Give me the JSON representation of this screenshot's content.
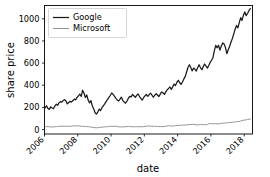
{
  "chart_data": {
    "type": "line",
    "title": "",
    "xlabel": "date",
    "ylabel": "share price",
    "xlim": [
      2006.0,
      2018.5
    ],
    "ylim": [
      -40,
      1120
    ],
    "xticks": [
      2006,
      2008,
      2010,
      2012,
      2014,
      2016,
      2018
    ],
    "xticklabels": [
      "2006",
      "2008",
      "2010",
      "2012",
      "2014",
      "2016",
      "2018"
    ],
    "xtick_rotation": 45,
    "yticks": [
      0,
      200,
      400,
      600,
      800,
      1000
    ],
    "yticklabels": [
      "0",
      "200",
      "400",
      "600",
      "800",
      "1000"
    ],
    "grid": false,
    "legend_position": "upper left",
    "legend_entries": [
      "Google",
      "Microsoft"
    ],
    "colors": {
      "google": "#1a1a1a",
      "microsoft": "#8c8c8c",
      "axis": "#000000",
      "background": "#ffffff",
      "legend_border": "#cccccc"
    },
    "x": [
      2006.04,
      2006.12,
      2006.21,
      2006.29,
      2006.37,
      2006.46,
      2006.54,
      2006.62,
      2006.71,
      2006.79,
      2006.87,
      2006.96,
      2007.04,
      2007.12,
      2007.21,
      2007.29,
      2007.37,
      2007.46,
      2007.54,
      2007.62,
      2007.71,
      2007.79,
      2007.87,
      2007.96,
      2008.04,
      2008.12,
      2008.21,
      2008.29,
      2008.37,
      2008.46,
      2008.54,
      2008.62,
      2008.71,
      2008.79,
      2008.87,
      2008.96,
      2009.04,
      2009.12,
      2009.21,
      2009.29,
      2009.37,
      2009.46,
      2009.54,
      2009.62,
      2009.71,
      2009.79,
      2009.87,
      2009.96,
      2010.04,
      2010.12,
      2010.21,
      2010.29,
      2010.37,
      2010.46,
      2010.54,
      2010.62,
      2010.71,
      2010.79,
      2010.87,
      2010.96,
      2011.04,
      2011.12,
      2011.21,
      2011.29,
      2011.37,
      2011.46,
      2011.54,
      2011.62,
      2011.71,
      2011.79,
      2011.87,
      2011.96,
      2012.04,
      2012.12,
      2012.21,
      2012.29,
      2012.37,
      2012.46,
      2012.54,
      2012.62,
      2012.71,
      2012.79,
      2012.87,
      2012.96,
      2013.04,
      2013.12,
      2013.21,
      2013.29,
      2013.37,
      2013.46,
      2013.54,
      2013.62,
      2013.71,
      2013.79,
      2013.87,
      2013.96,
      2014.04,
      2014.12,
      2014.21,
      2014.29,
      2014.37,
      2014.46,
      2014.54,
      2014.62,
      2014.71,
      2014.79,
      2014.87,
      2014.96,
      2015.04,
      2015.12,
      2015.21,
      2015.29,
      2015.37,
      2015.46,
      2015.54,
      2015.62,
      2015.71,
      2015.79,
      2015.87,
      2015.96,
      2016.04,
      2016.12,
      2016.21,
      2016.29,
      2016.37,
      2016.46,
      2016.54,
      2016.62,
      2016.71,
      2016.79,
      2016.87,
      2016.96,
      2017.04,
      2017.12,
      2017.21,
      2017.29,
      2017.37,
      2017.46,
      2017.54,
      2017.62,
      2017.71,
      2017.79,
      2017.87,
      2017.96,
      2018.04,
      2018.12,
      2018.21,
      2018.29,
      2018.37
    ],
    "series": [
      {
        "name": "Google",
        "color": "#1a1a1a",
        "values": [
          196,
          215,
          190,
          182,
          205,
          195,
          188,
          212,
          230,
          218,
          242,
          252,
          248,
          262,
          270,
          258,
          232,
          245,
          255,
          248,
          262,
          275,
          268,
          290,
          305,
          320,
          300,
          355,
          330,
          290,
          312,
          268,
          240,
          262,
          215,
          185,
          152,
          140,
          160,
          185,
          172,
          200,
          215,
          232,
          255,
          272,
          290,
          310,
          330,
          318,
          300,
          282,
          268,
          258,
          275,
          292,
          262,
          248,
          238,
          258,
          282,
          300,
          295,
          318,
          305,
          290,
          308,
          322,
          298,
          282,
          265,
          290,
          305,
          318,
          300,
          315,
          328,
          310,
          292,
          308,
          325,
          312,
          298,
          320,
          340,
          332,
          318,
          340,
          358,
          372,
          385,
          362,
          388,
          410,
          398,
          428,
          445,
          425,
          408,
          430,
          455,
          480,
          520,
          560,
          585,
          560,
          530,
          555,
          545,
          528,
          560,
          585,
          560,
          540,
          568,
          592,
          572,
          555,
          578,
          608,
          625,
          648,
          712,
          760,
          738,
          760,
          718,
          752,
          782,
          772,
          742,
          685,
          720,
          748,
          790,
          822,
          862,
          908,
          940,
          918,
          968,
          1010,
          985,
          1035,
          1062,
          1028,
          1050,
          1075,
          1092
        ]
      },
      {
        "name": "Microsoft",
        "color": "#8c8c8c",
        "values": [
          26,
          27,
          26,
          25,
          24,
          23,
          24,
          26,
          27,
          28,
          29,
          30,
          31,
          30,
          29,
          30,
          31,
          30,
          29,
          30,
          32,
          34,
          33,
          33,
          34,
          32,
          29,
          30,
          29,
          28,
          27,
          26,
          25,
          22,
          20,
          19,
          17,
          16,
          17,
          19,
          20,
          22,
          23,
          24,
          25,
          26,
          28,
          30,
          30,
          29,
          29,
          30,
          28,
          25,
          24,
          25,
          24,
          25,
          26,
          27,
          28,
          27,
          26,
          26,
          25,
          26,
          27,
          26,
          25,
          26,
          26,
          26,
          29,
          31,
          31,
          32,
          31,
          30,
          30,
          29,
          30,
          28,
          27,
          27,
          27,
          28,
          28,
          30,
          33,
          34,
          34,
          32,
          32,
          33,
          36,
          37,
          38,
          38,
          39,
          40,
          40,
          41,
          42,
          44,
          45,
          46,
          47,
          46,
          46,
          43,
          42,
          44,
          46,
          46,
          45,
          44,
          43,
          46,
          52,
          54,
          54,
          51,
          54,
          53,
          51,
          51,
          53,
          56,
          57,
          58,
          59,
          61,
          63,
          64,
          65,
          66,
          68,
          69,
          71,
          72,
          73,
          77,
          82,
          84,
          86,
          88,
          91,
          93,
          95
        ]
      }
    ]
  }
}
